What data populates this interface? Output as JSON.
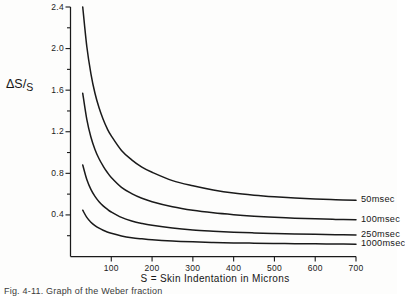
{
  "figure": {
    "caption": "Fig. 4-11. Graph of the Weber fraction",
    "y_axis_title_parts": {
      "numerator": "ΔS",
      "slash": "/",
      "denominator": "S"
    },
    "x_axis_title": "S = Skin Indentation in Microns",
    "ink_color": "#1a1a1a",
    "paper_color": "#fdfdfc"
  },
  "chart_data": {
    "type": "line",
    "title": "",
    "subtitle": "",
    "xlabel": "S = Skin Indentation in Microns",
    "ylabel": "ΔS/S",
    "xlim": [
      0,
      700
    ],
    "ylim": [
      0,
      2.4
    ],
    "grid": false,
    "legend_position": "right-inline-end-of-curve",
    "x_ticks": [
      100,
      200,
      300,
      400,
      500,
      600,
      700
    ],
    "x_tick_labels": [
      "100",
      "200",
      "300",
      "400",
      "500",
      "600",
      "700"
    ],
    "y_ticks": [
      0.4,
      0.8,
      1.2,
      1.6,
      2.0,
      2.4
    ],
    "y_tick_labels": [
      "0.4",
      "0.8",
      "1.2",
      "1.6",
      "2.0",
      "2.4"
    ],
    "y_minor_ticks": [
      0.2,
      0.6,
      1.0,
      1.4,
      1.8,
      2.2
    ],
    "x": [
      30,
      40,
      50,
      60,
      70,
      80,
      90,
      100,
      125,
      150,
      175,
      200,
      250,
      300,
      350,
      400,
      450,
      500,
      550,
      600,
      650,
      700
    ],
    "series": [
      {
        "name": "50msec",
        "label": "50msec",
        "values": [
          2.4,
          2.02,
          1.76,
          1.57,
          1.43,
          1.32,
          1.23,
          1.16,
          1.02,
          0.93,
          0.86,
          0.81,
          0.73,
          0.68,
          0.64,
          0.61,
          0.59,
          0.575,
          0.563,
          0.553,
          0.546,
          0.54
        ]
      },
      {
        "name": "100msec",
        "label": "100msec",
        "values": [
          1.57,
          1.32,
          1.15,
          1.03,
          0.94,
          0.87,
          0.81,
          0.76,
          0.665,
          0.605,
          0.56,
          0.527,
          0.478,
          0.444,
          0.42,
          0.402,
          0.388,
          0.377,
          0.369,
          0.362,
          0.357,
          0.353
        ]
      },
      {
        "name": "250msec",
        "label": "250msec",
        "values": [
          0.88,
          0.74,
          0.645,
          0.578,
          0.527,
          0.487,
          0.455,
          0.428,
          0.376,
          0.342,
          0.318,
          0.3,
          0.274,
          0.256,
          0.244,
          0.234,
          0.227,
          0.221,
          0.217,
          0.213,
          0.21,
          0.208
        ]
      },
      {
        "name": "1000msec",
        "label": "1000msec",
        "values": [
          0.445,
          0.376,
          0.33,
          0.297,
          0.272,
          0.252,
          0.236,
          0.223,
          0.198,
          0.181,
          0.17,
          0.161,
          0.149,
          0.141,
          0.135,
          0.131,
          0.128,
          0.125,
          0.123,
          0.122,
          0.12,
          0.119
        ]
      }
    ]
  }
}
